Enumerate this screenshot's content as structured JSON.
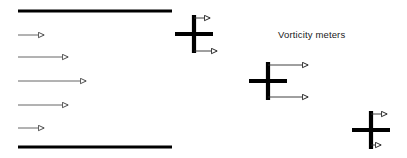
{
  "figure": {
    "width": 407,
    "height": 158,
    "background": "#ffffff"
  },
  "colors": {
    "wall": "#000000",
    "meter": "#000000",
    "arrow_stroke": "#4a4a4a",
    "arrowhead_fill": "#ffffff",
    "text": "#1a1a1a"
  },
  "annotations": {
    "vorticity_meters_label": "Vorticity meters",
    "label_x": 278,
    "label_y": 38
  },
  "walls": [
    {
      "name": "top-wall",
      "x1": 18,
      "y1": 11,
      "x2": 172,
      "y2": 11,
      "thickness": 3.2
    },
    {
      "name": "bottom-wall",
      "x1": 18,
      "y1": 147,
      "x2": 172,
      "y2": 147,
      "thickness": 3.2
    }
  ],
  "velocity_profile": {
    "type": "parabolic",
    "origin_x": 18,
    "arrows": [
      {
        "id": 1,
        "y": 35,
        "x_start": 18,
        "x_tip": 47,
        "length": 29
      },
      {
        "id": 2,
        "y": 57,
        "x_start": 18,
        "x_tip": 71,
        "length": 53
      },
      {
        "id": 3,
        "y": 81,
        "x_start": 18,
        "x_tip": 89,
        "length": 71
      },
      {
        "id": 4,
        "y": 105,
        "x_start": 18,
        "x_tip": 71,
        "length": 53
      },
      {
        "id": 5,
        "y": 128,
        "x_start": 18,
        "x_tip": 47,
        "length": 29
      }
    ]
  },
  "vorticity_meters": [
    {
      "id": 1,
      "center_x": 194,
      "center_y": 34,
      "arm_half_length": 19,
      "arm_thickness": 4.2,
      "top_arrow": {
        "x_start": 194,
        "y": 18,
        "x_tip": 213
      },
      "bottom_arrow": {
        "x_start": 194,
        "y": 51,
        "x_tip": 220
      }
    },
    {
      "id": 2,
      "center_x": 268,
      "center_y": 81,
      "arm_half_length": 19,
      "arm_thickness": 4.2,
      "top_arrow": {
        "x_start": 268,
        "y": 65,
        "x_tip": 311
      },
      "bottom_arrow": {
        "x_start": 268,
        "y": 97,
        "x_tip": 311
      }
    },
    {
      "id": 3,
      "center_x": 371,
      "center_y": 130,
      "arm_half_length": 19,
      "arm_thickness": 4.2,
      "top_arrow": {
        "x_start": 371,
        "y": 114,
        "x_tip": 390
      },
      "bottom_arrow": {
        "x_start": 371,
        "y": 145,
        "x_tip": 384
      }
    }
  ]
}
